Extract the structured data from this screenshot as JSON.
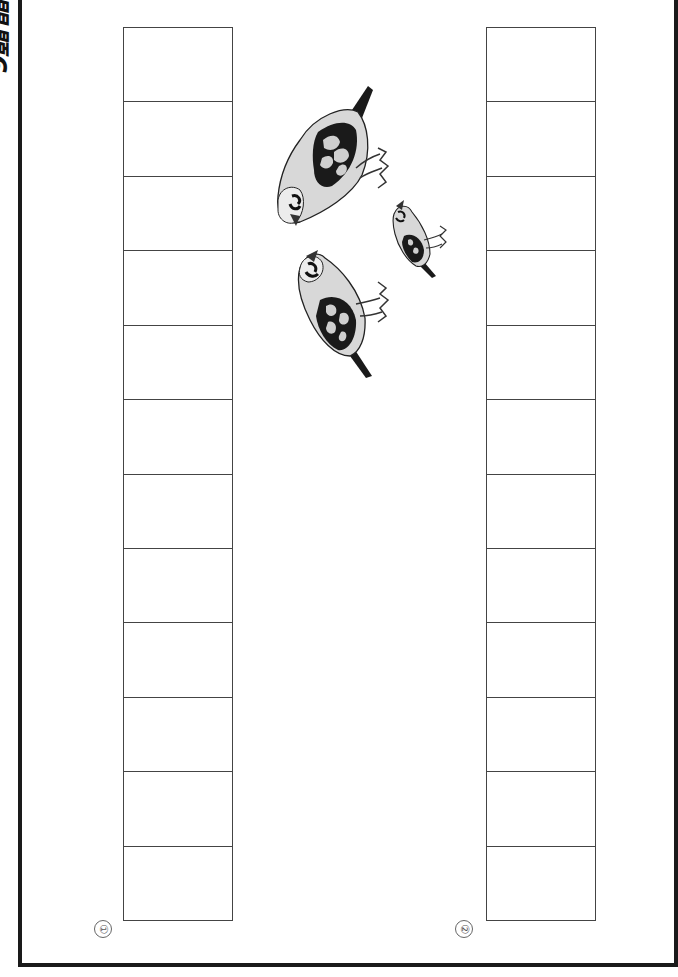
{
  "header": {
    "title": "問題6"
  },
  "answer_grids": [
    {
      "label": "①",
      "rows": 12
    },
    {
      "label": "②",
      "rows": 12
    }
  ],
  "illustration": {
    "subject": "three sparrows (two adults, one chick)",
    "icon": "bird-illustration"
  },
  "colors": {
    "border": "#1a1a1a",
    "grid_line": "#444444",
    "bird_fill": "#d8d8d8",
    "bird_dark": "#1a1a1a"
  }
}
